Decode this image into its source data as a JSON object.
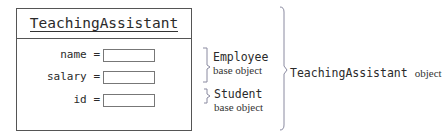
{
  "object_box": {
    "class_name": "TeachingAssistant",
    "fields": [
      {
        "label": "name",
        "op": "=",
        "value": ""
      },
      {
        "label": "salary",
        "op": "=",
        "value": ""
      },
      {
        "label": "id",
        "op": "=",
        "value": ""
      }
    ]
  },
  "annotations": {
    "employee": {
      "class_name": "Employee",
      "description": "base object"
    },
    "student": {
      "class_name": "Student",
      "description": "base object"
    },
    "whole": {
      "class_name": "TeachingAssistant",
      "description": "object"
    }
  },
  "colors": {
    "border": "#555555",
    "bracket": "#8a8aa0",
    "text": "#2a2a2a"
  }
}
